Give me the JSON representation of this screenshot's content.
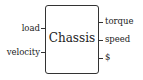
{
  "block": {
    "title": "Chassis",
    "inputs": [
      {
        "label": "load"
      },
      {
        "label": "velocity"
      }
    ],
    "outputs": [
      {
        "label": "torque"
      },
      {
        "label": "speed"
      },
      {
        "label": "$"
      }
    ]
  }
}
